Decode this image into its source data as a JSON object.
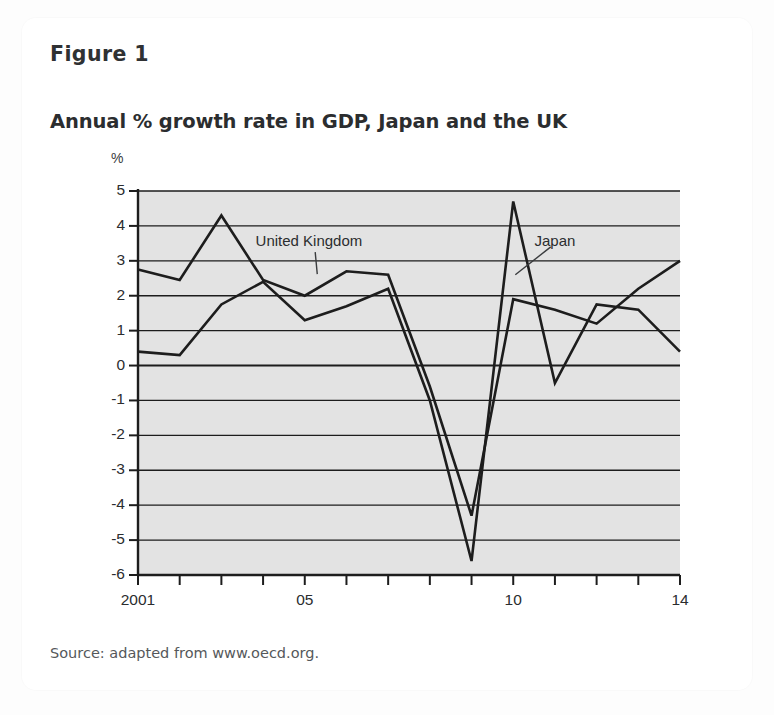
{
  "figure": {
    "number_label": "Figure 1",
    "title": "Annual % growth rate in GDP, Japan and the UK",
    "source": "Source: adapted from www.oecd.org."
  },
  "chart_data": {
    "type": "line",
    "title": "Annual % growth rate in GDP, Japan and the UK",
    "xlabel": "",
    "ylabel": "%",
    "unit_label": "%",
    "x": [
      2001,
      2002,
      2003,
      2004,
      2005,
      2006,
      2007,
      2008,
      2009,
      2010,
      2011,
      2012,
      2013,
      2014
    ],
    "xtick_labels": [
      "2001",
      "",
      "",
      "",
      "05",
      "",
      "",
      "",
      "",
      "10",
      "",
      "",
      "",
      "14"
    ],
    "xlim": [
      2001,
      2014
    ],
    "ylim": [
      -6,
      5
    ],
    "yticks": [
      5,
      4,
      3,
      2,
      1,
      0,
      -1,
      -2,
      -3,
      -4,
      -5,
      -6
    ],
    "ytick_labels": [
      "5",
      "4",
      "3",
      "2",
      "1",
      "0",
      "-1",
      "-2",
      "-3",
      "-4",
      "-5",
      "-6"
    ],
    "grid": true,
    "grid_axis": "y",
    "plot_background": "#e3e3e3",
    "line_color": "#1d1d1d",
    "legend": "inline-annotations",
    "series": [
      {
        "name": "United Kingdom",
        "label_x": 2005.1,
        "label_y": 3.55,
        "leader_from": [
          2005.25,
          3.25
        ],
        "leader_to": [
          2005.3,
          2.62
        ],
        "values": [
          2.75,
          2.45,
          4.3,
          2.45,
          2.0,
          2.7,
          2.6,
          -0.6,
          -4.3,
          1.9,
          1.6,
          1.2,
          2.2,
          3.0
        ]
      },
      {
        "name": "Japan",
        "label_x": 2011.0,
        "label_y": 3.55,
        "leader_from": [
          2010.9,
          3.4
        ],
        "leader_to": [
          2010.05,
          2.6
        ],
        "values": [
          0.4,
          0.3,
          1.75,
          2.4,
          1.3,
          1.7,
          2.2,
          -1.0,
          -5.6,
          4.7,
          -0.5,
          1.75,
          1.6,
          0.4
        ]
      }
    ],
    "annotations": [
      {
        "text": "United Kingdom",
        "x": 2005.1,
        "y": 3.55
      },
      {
        "text": "Japan",
        "x": 2011.0,
        "y": 3.55
      }
    ]
  }
}
